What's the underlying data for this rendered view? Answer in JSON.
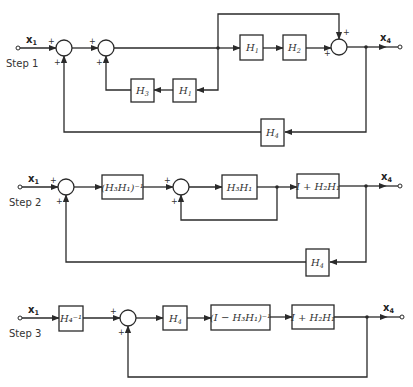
{
  "diagram": {
    "type": "block-diagram-reduction",
    "steps": [
      {
        "label": "Step 1",
        "input": "x",
        "input_sub": "1",
        "output": "x",
        "output_sub": "4",
        "blocks": [
          {
            "id": "H1_fwd",
            "text": "H",
            "sub": "1"
          },
          {
            "id": "H2_fwd",
            "text": "H",
            "sub": "2"
          },
          {
            "id": "H3_fb",
            "text": "H",
            "sub": "3"
          },
          {
            "id": "H1_fb",
            "text": "H",
            "sub": "1"
          },
          {
            "id": "H4_fb",
            "text": "H",
            "sub": "4"
          }
        ],
        "signs": [
          "+",
          "+",
          "+",
          "+",
          "+",
          "+"
        ]
      },
      {
        "label": "Step 2",
        "input": "x",
        "input_sub": "1",
        "output": "x",
        "output_sub": "4",
        "blocks": [
          {
            "id": "inv_H3H1",
            "text": "(H₃H₁)⁻¹"
          },
          {
            "id": "H3H1",
            "text": "H₃H₁"
          },
          {
            "id": "I_plus_H2H1",
            "text": "I + H₂H₁"
          },
          {
            "id": "H4_fb",
            "text": "H",
            "sub": "4"
          }
        ],
        "signs": [
          "+",
          "+",
          "+",
          "+"
        ]
      },
      {
        "label": "Step 3",
        "input": "x",
        "input_sub": "1",
        "output": "x",
        "output_sub": "4",
        "blocks": [
          {
            "id": "H4_inv",
            "text": "H₄⁻¹"
          },
          {
            "id": "H4",
            "text": "H",
            "sub": "4"
          },
          {
            "id": "inv_I_minus_H3H1",
            "text": "(I − H₃H₁)⁻¹"
          },
          {
            "id": "I_plus_H2H1",
            "text": "I + H₂H₁"
          }
        ],
        "signs": [
          "+",
          "+"
        ]
      }
    ]
  }
}
